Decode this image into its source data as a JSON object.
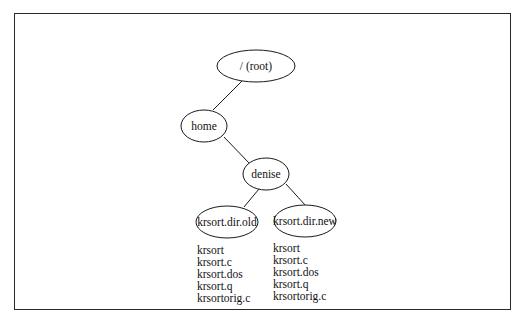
{
  "diagram": {
    "type": "directory-tree",
    "nodes": [
      {
        "id": "root",
        "label": "/ (root)"
      },
      {
        "id": "home",
        "label": "home"
      },
      {
        "id": "denise",
        "label": "denise"
      },
      {
        "id": "krsort_dir_old",
        "label": "krsort.dir.old"
      },
      {
        "id": "krsort_dir_new",
        "label": "krsort.dir.new"
      }
    ],
    "edges": [
      {
        "from": "root",
        "to": "home"
      },
      {
        "from": "home",
        "to": "denise"
      },
      {
        "from": "denise",
        "to": "krsort_dir_old"
      },
      {
        "from": "denise",
        "to": "krsort_dir_new"
      }
    ],
    "files": {
      "krsort_dir_old": [
        "krsort",
        "krsort.c",
        "krsort.dos",
        "krsort.q",
        "krsortorig.c"
      ],
      "krsort_dir_new": [
        "krsort",
        "krsort.c",
        "krsort.dos",
        "krsort.q",
        "krsortorig.c"
      ]
    }
  },
  "colors": {
    "stroke": "#1a1a1a",
    "border": "#2a2a2a",
    "background": "#ffffff"
  }
}
